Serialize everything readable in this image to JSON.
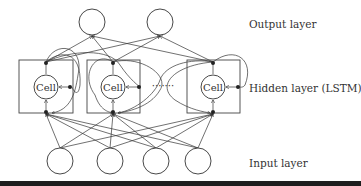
{
  "labels": {
    "output": "Output layer",
    "hidden": "Hidden layer (LSTM)",
    "input": "Input layer"
  },
  "cells": [
    {
      "label": "Cell"
    },
    {
      "label": "Cell"
    },
    {
      "label": "Cell"
    }
  ],
  "ellipsis": "·······",
  "layers": {
    "output_nodes": 2,
    "hidden_lstm_blocks": 3,
    "input_nodes": 4
  },
  "colors": {
    "stroke": "#333333",
    "background": "#ffffff",
    "bottom_bar": "#1e1e1e"
  }
}
